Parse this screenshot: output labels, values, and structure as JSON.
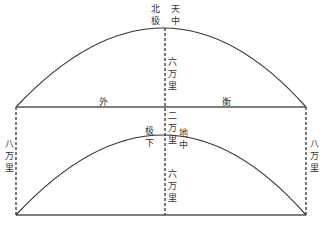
{
  "diagram": {
    "title_top": {
      "left_col": [
        "北",
        "极"
      ],
      "right_col": [
        "天",
        "中"
      ]
    },
    "upper_center_distance": "六万里",
    "horizontal_line_labels": {
      "left": "外",
      "right": "衡"
    },
    "gap_distance": "二万里",
    "lower_apex_labels": {
      "left": "极下",
      "right": "地中"
    },
    "lower_center_distance": "六万里",
    "side_distance_left": "八万里",
    "side_distance_right": "八万里",
    "colors": {
      "line": "#333333",
      "text": "#333333"
    }
  },
  "labels": {
    "bei": "北",
    "ji_top": "极",
    "tian": "天",
    "zhong_top": "中",
    "wai": "外",
    "heng": "衡",
    "ji_bottom": "极",
    "xia": "下",
    "di": "地",
    "zhong_bottom": "中",
    "upper_center": "六万里",
    "gap": "二万里",
    "lower_center": "六万里",
    "left_side": "八万里",
    "right_side": "八万里"
  }
}
